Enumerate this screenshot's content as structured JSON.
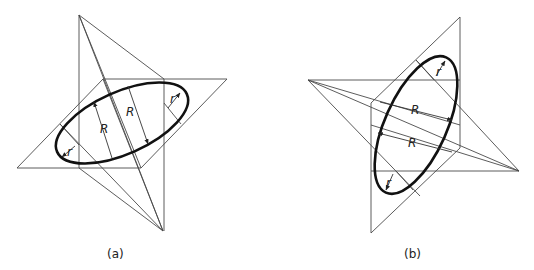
{
  "figures": [
    {
      "id": "a",
      "caption": "(a)",
      "labels": {
        "R1": "R",
        "R2": "R",
        "r1": "r",
        "r2": "r"
      }
    },
    {
      "id": "b",
      "caption": "(b)",
      "labels": {
        "R1": "R",
        "R2": "R",
        "r1": "r",
        "r2": "r"
      }
    }
  ],
  "colors": {
    "construction_line": "#4a4a4a",
    "ellipse": "#111111",
    "background": "#ffffff"
  }
}
